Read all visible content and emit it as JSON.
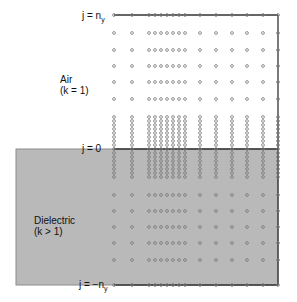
{
  "diagram": {
    "regions": [
      {
        "id": "air",
        "name": "Air",
        "param": "(k = 1)"
      },
      {
        "id": "dielectric",
        "name": "Dielectric",
        "param": "(k > 1)"
      }
    ],
    "boundary_labels": {
      "top": {
        "prefix": "j = n",
        "sub": "y"
      },
      "interface": {
        "text": "j = 0"
      },
      "bottom": {
        "prefix": "j = −n",
        "sub": "y"
      }
    },
    "colors": {
      "dielectric_fill": "#b9b9b9",
      "dielectric_border": "#8c8c8c",
      "grid_line": "#333333",
      "node_stroke": "#777777",
      "background": "#ffffff"
    },
    "grid": {
      "columns_x": [
        114,
        132,
        149,
        155,
        161,
        167,
        173,
        179,
        185,
        200,
        216,
        232,
        247,
        263,
        278
      ],
      "rows_y_air": [
        33,
        50,
        66,
        82,
        99,
        117,
        121,
        125,
        129,
        133,
        137,
        141,
        145
      ],
      "row_top_y": 15,
      "row_interface_y": 149,
      "rows_y_dielectric": [
        153,
        157,
        161,
        165,
        169,
        173,
        177,
        195,
        211,
        227,
        243,
        260
      ],
      "row_bottom_y": 285,
      "right_edge_x": 278
    }
  }
}
